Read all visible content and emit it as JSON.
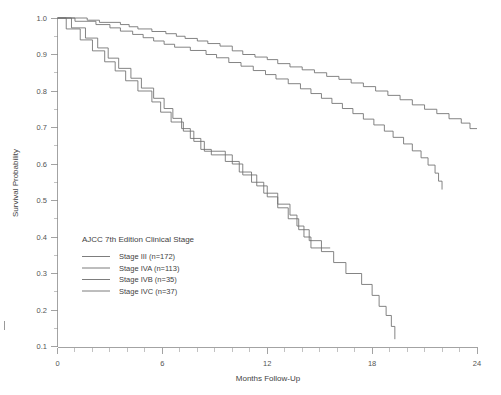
{
  "chart_data": {
    "type": "line",
    "subtype": "kaplan-meier-step",
    "title": "",
    "xlabel": "Months Follow-Up",
    "ylabel": "Survival Probability",
    "xlim": [
      0,
      24
    ],
    "ylim": [
      0.1,
      1.0
    ],
    "xticks": [
      0,
      6,
      12,
      18,
      24
    ],
    "xtick_labels": [
      "0",
      "6",
      "12",
      "18",
      "24"
    ],
    "x_minor_tick_interval": 1,
    "yticks": [
      0.1,
      0.2,
      0.3,
      0.4,
      0.5,
      0.6,
      0.7,
      0.8,
      0.9,
      1.0
    ],
    "ytick_labels": [
      "0.1",
      "0.2",
      "0.3",
      "0.4",
      "0.5",
      "0.6",
      "0.7",
      "0.8",
      "0.9",
      "1.0"
    ],
    "grid": false,
    "legend_position": "inside-lower-left",
    "legend_title": "AJCC 7th Edition Clinical Stage",
    "line_color": "#6e6e6e",
    "axis_color": "#8c8c8c",
    "background": "#ffffff",
    "series": [
      {
        "name": "Stage III (n=172)",
        "label": "Stage III (n=172)",
        "n": 172,
        "end_x": 24.0,
        "end_y": 0.69,
        "steps": [
          [
            0.0,
            1.0
          ],
          [
            1.7,
            1.0
          ],
          [
            1.7,
            0.994
          ],
          [
            2.4,
            0.994
          ],
          [
            2.4,
            0.988
          ],
          [
            3.6,
            0.988
          ],
          [
            3.6,
            0.982
          ],
          [
            4.1,
            0.982
          ],
          [
            4.1,
            0.976
          ],
          [
            4.6,
            0.976
          ],
          [
            4.6,
            0.97
          ],
          [
            5.4,
            0.97
          ],
          [
            5.4,
            0.963
          ],
          [
            6.2,
            0.963
          ],
          [
            6.2,
            0.957
          ],
          [
            6.8,
            0.957
          ],
          [
            6.8,
            0.95
          ],
          [
            7.3,
            0.95
          ],
          [
            7.3,
            0.944
          ],
          [
            8.0,
            0.944
          ],
          [
            8.0,
            0.937
          ],
          [
            8.6,
            0.937
          ],
          [
            8.6,
            0.93
          ],
          [
            9.3,
            0.93
          ],
          [
            9.3,
            0.923
          ],
          [
            10.0,
            0.923
          ],
          [
            10.0,
            0.91
          ],
          [
            10.6,
            0.91
          ],
          [
            10.6,
            0.9
          ],
          [
            11.3,
            0.9
          ],
          [
            11.3,
            0.893
          ],
          [
            12.0,
            0.893
          ],
          [
            12.0,
            0.886
          ],
          [
            12.6,
            0.886
          ],
          [
            12.6,
            0.875
          ],
          [
            13.3,
            0.875
          ],
          [
            13.3,
            0.866
          ],
          [
            14.0,
            0.866
          ],
          [
            14.0,
            0.858
          ],
          [
            14.7,
            0.858
          ],
          [
            14.7,
            0.85
          ],
          [
            15.4,
            0.85
          ],
          [
            15.4,
            0.84
          ],
          [
            16.1,
            0.84
          ],
          [
            16.1,
            0.832
          ],
          [
            16.8,
            0.832
          ],
          [
            16.8,
            0.822
          ],
          [
            17.5,
            0.822
          ],
          [
            17.5,
            0.812
          ],
          [
            18.2,
            0.812
          ],
          [
            18.2,
            0.8
          ],
          [
            18.9,
            0.8
          ],
          [
            18.9,
            0.788
          ],
          [
            19.6,
            0.788
          ],
          [
            19.6,
            0.776
          ],
          [
            20.3,
            0.776
          ],
          [
            20.3,
            0.762
          ],
          [
            21.0,
            0.762
          ],
          [
            21.0,
            0.75
          ],
          [
            21.7,
            0.75
          ],
          [
            21.7,
            0.738
          ],
          [
            22.4,
            0.738
          ],
          [
            22.4,
            0.724
          ],
          [
            23.1,
            0.724
          ],
          [
            23.1,
            0.712
          ],
          [
            23.6,
            0.712
          ],
          [
            23.6,
            0.697
          ],
          [
            24.0,
            0.697
          ]
        ]
      },
      {
        "name": "Stage IVA (n=113)",
        "label": "Stage IVA (n=113)",
        "n": 113,
        "end_x": 22.0,
        "end_y": 0.53,
        "steps": [
          [
            0.0,
            1.0
          ],
          [
            1.0,
            1.0
          ],
          [
            1.0,
            0.991
          ],
          [
            2.2,
            0.991
          ],
          [
            2.2,
            0.982
          ],
          [
            3.0,
            0.982
          ],
          [
            3.0,
            0.973
          ],
          [
            3.6,
            0.973
          ],
          [
            3.6,
            0.964
          ],
          [
            4.3,
            0.964
          ],
          [
            4.3,
            0.955
          ],
          [
            4.9,
            0.955
          ],
          [
            4.9,
            0.946
          ],
          [
            5.5,
            0.946
          ],
          [
            5.5,
            0.937
          ],
          [
            6.1,
            0.937
          ],
          [
            6.1,
            0.928
          ],
          [
            6.7,
            0.928
          ],
          [
            6.7,
            0.92
          ],
          [
            7.6,
            0.92
          ],
          [
            7.6,
            0.911
          ],
          [
            8.5,
            0.911
          ],
          [
            8.5,
            0.9
          ],
          [
            9.1,
            0.9
          ],
          [
            9.1,
            0.891
          ],
          [
            9.8,
            0.891
          ],
          [
            9.8,
            0.878
          ],
          [
            10.5,
            0.878
          ],
          [
            10.5,
            0.868
          ],
          [
            11.2,
            0.868
          ],
          [
            11.2,
            0.856
          ],
          [
            11.9,
            0.856
          ],
          [
            11.9,
            0.845
          ],
          [
            12.5,
            0.845
          ],
          [
            12.5,
            0.833
          ],
          [
            13.2,
            0.833
          ],
          [
            13.2,
            0.82
          ],
          [
            13.9,
            0.82
          ],
          [
            13.9,
            0.806
          ],
          [
            14.5,
            0.806
          ],
          [
            14.5,
            0.793
          ],
          [
            15.1,
            0.793
          ],
          [
            15.1,
            0.78
          ],
          [
            15.7,
            0.78
          ],
          [
            15.7,
            0.766
          ],
          [
            16.3,
            0.766
          ],
          [
            16.3,
            0.752
          ],
          [
            16.9,
            0.752
          ],
          [
            16.9,
            0.738
          ],
          [
            17.5,
            0.738
          ],
          [
            17.5,
            0.723
          ],
          [
            18.1,
            0.723
          ],
          [
            18.1,
            0.707
          ],
          [
            18.7,
            0.707
          ],
          [
            18.7,
            0.69
          ],
          [
            19.2,
            0.69
          ],
          [
            19.2,
            0.673
          ],
          [
            19.8,
            0.673
          ],
          [
            19.8,
            0.655
          ],
          [
            20.3,
            0.655
          ],
          [
            20.3,
            0.636
          ],
          [
            20.8,
            0.636
          ],
          [
            20.8,
            0.617
          ],
          [
            21.2,
            0.617
          ],
          [
            21.2,
            0.597
          ],
          [
            21.6,
            0.597
          ],
          [
            21.6,
            0.575
          ],
          [
            21.8,
            0.575
          ],
          [
            21.8,
            0.553
          ],
          [
            22.0,
            0.553
          ],
          [
            22.0,
            0.53
          ]
        ]
      },
      {
        "name": "Stage IVB (n=35)",
        "label": "Stage IVB (n=35)",
        "n": 35,
        "end_x": 15.6,
        "end_y": 0.37,
        "steps": [
          [
            0.0,
            1.0
          ],
          [
            0.5,
            1.0
          ],
          [
            0.5,
            0.97
          ],
          [
            1.3,
            0.97
          ],
          [
            1.3,
            0.94
          ],
          [
            2.0,
            0.94
          ],
          [
            2.0,
            0.91
          ],
          [
            2.7,
            0.91
          ],
          [
            2.7,
            0.88
          ],
          [
            3.3,
            0.88
          ],
          [
            3.3,
            0.855
          ],
          [
            3.9,
            0.855
          ],
          [
            3.9,
            0.828
          ],
          [
            4.6,
            0.828
          ],
          [
            4.6,
            0.8
          ],
          [
            5.4,
            0.8
          ],
          [
            5.4,
            0.77
          ],
          [
            5.9,
            0.77
          ],
          [
            5.9,
            0.742
          ],
          [
            6.5,
            0.742
          ],
          [
            6.5,
            0.715
          ],
          [
            7.2,
            0.715
          ],
          [
            7.2,
            0.69
          ],
          [
            7.8,
            0.69
          ],
          [
            7.8,
            0.662
          ],
          [
            8.4,
            0.662
          ],
          [
            8.4,
            0.635
          ],
          [
            9.6,
            0.635
          ],
          [
            9.6,
            0.607
          ],
          [
            10.4,
            0.607
          ],
          [
            10.4,
            0.578
          ],
          [
            11.1,
            0.578
          ],
          [
            11.1,
            0.55
          ],
          [
            11.8,
            0.55
          ],
          [
            11.8,
            0.52
          ],
          [
            12.6,
            0.52
          ],
          [
            12.6,
            0.49
          ],
          [
            13.3,
            0.49
          ],
          [
            13.3,
            0.46
          ],
          [
            13.7,
            0.46
          ],
          [
            13.7,
            0.43
          ],
          [
            14.1,
            0.43
          ],
          [
            14.1,
            0.4
          ],
          [
            14.5,
            0.4
          ],
          [
            14.5,
            0.37
          ],
          [
            15.6,
            0.37
          ]
        ]
      },
      {
        "name": "Stage IVC (n=37)",
        "label": "Stage IVC (n=37)",
        "n": 37,
        "end_x": 19.3,
        "end_y": 0.12,
        "steps": [
          [
            0.0,
            1.0
          ],
          [
            0.8,
            1.0
          ],
          [
            0.8,
            0.973
          ],
          [
            1.6,
            0.973
          ],
          [
            1.6,
            0.945
          ],
          [
            2.3,
            0.945
          ],
          [
            2.3,
            0.918
          ],
          [
            2.9,
            0.918
          ],
          [
            2.9,
            0.89
          ],
          [
            3.5,
            0.89
          ],
          [
            3.5,
            0.862
          ],
          [
            4.2,
            0.862
          ],
          [
            4.2,
            0.835
          ],
          [
            4.8,
            0.835
          ],
          [
            4.8,
            0.808
          ],
          [
            5.5,
            0.808
          ],
          [
            5.5,
            0.78
          ],
          [
            6.1,
            0.78
          ],
          [
            6.1,
            0.752
          ],
          [
            6.6,
            0.752
          ],
          [
            6.6,
            0.725
          ],
          [
            7.1,
            0.725
          ],
          [
            7.1,
            0.697
          ],
          [
            7.6,
            0.697
          ],
          [
            7.6,
            0.67
          ],
          [
            8.2,
            0.67
          ],
          [
            8.2,
            0.64
          ],
          [
            8.8,
            0.64
          ],
          [
            8.8,
            0.625
          ],
          [
            10.0,
            0.625
          ],
          [
            10.0,
            0.6
          ],
          [
            10.6,
            0.6
          ],
          [
            10.6,
            0.57
          ],
          [
            11.4,
            0.57
          ],
          [
            11.4,
            0.54
          ],
          [
            12.0,
            0.54
          ],
          [
            12.0,
            0.51
          ],
          [
            12.6,
            0.51
          ],
          [
            12.6,
            0.48
          ],
          [
            13.2,
            0.48
          ],
          [
            13.2,
            0.45
          ],
          [
            13.8,
            0.45
          ],
          [
            13.8,
            0.42
          ],
          [
            14.4,
            0.42
          ],
          [
            14.4,
            0.39
          ],
          [
            15.1,
            0.39
          ],
          [
            15.1,
            0.36
          ],
          [
            15.8,
            0.36
          ],
          [
            15.8,
            0.33
          ],
          [
            16.5,
            0.33
          ],
          [
            16.5,
            0.3
          ],
          [
            17.4,
            0.3
          ],
          [
            17.4,
            0.27
          ],
          [
            18.0,
            0.27
          ],
          [
            18.0,
            0.24
          ],
          [
            18.4,
            0.24
          ],
          [
            18.4,
            0.21
          ],
          [
            18.8,
            0.21
          ],
          [
            18.8,
            0.185
          ],
          [
            19.1,
            0.185
          ],
          [
            19.1,
            0.155
          ],
          [
            19.3,
            0.155
          ],
          [
            19.3,
            0.12
          ]
        ]
      }
    ]
  },
  "legend": {
    "title": "AJCC 7th Edition Clinical Stage",
    "entries": [
      {
        "label": "Stage III (n=172)"
      },
      {
        "label": "Stage IVA (n=113)"
      },
      {
        "label": "Stage IVB (n=35)"
      },
      {
        "label": "Stage IVC (n=37)"
      }
    ]
  },
  "axes": {
    "x_title": "Months Follow-Up",
    "y_title": "Survival Probability",
    "x_labels": [
      "0",
      "6",
      "12",
      "18",
      "24"
    ],
    "y_labels": [
      "1.0",
      "0.9",
      "0.8",
      "0.7",
      "0.6",
      "0.5",
      "0.4",
      "0.3",
      "0.2",
      "0.1"
    ]
  }
}
